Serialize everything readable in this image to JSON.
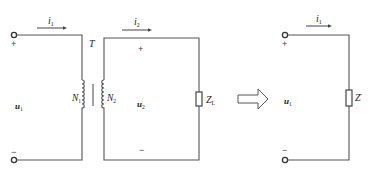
{
  "diagram": {
    "colors": {
      "wire": "#555555",
      "text": "#222222",
      "background": "#ffffff"
    },
    "left_circuit": {
      "current_primary": {
        "symbol": "i",
        "subscript": "1"
      },
      "current_secondary": {
        "symbol": "i",
        "subscript": "2"
      },
      "transformer_label": "T",
      "primary_winding": {
        "symbol": "N",
        "subscript": "1"
      },
      "secondary_winding": {
        "symbol": "N",
        "subscript": "2"
      },
      "input_voltage": {
        "symbol": "u",
        "subscript": "1"
      },
      "output_voltage": {
        "symbol": "u",
        "subscript": "2"
      },
      "input_plus": "+",
      "input_minus": "−",
      "output_plus": "+",
      "output_minus": "−",
      "load": {
        "symbol": "Z",
        "subscript": "L"
      }
    },
    "equivalence_arrow": "hollow-right-arrow",
    "right_circuit": {
      "current": {
        "symbol": "i",
        "subscript": "1"
      },
      "voltage": {
        "symbol": "u",
        "subscript": "1"
      },
      "plus": "+",
      "minus": "−",
      "equivalent_load": {
        "symbol": "Z",
        "prime": "′"
      }
    }
  }
}
